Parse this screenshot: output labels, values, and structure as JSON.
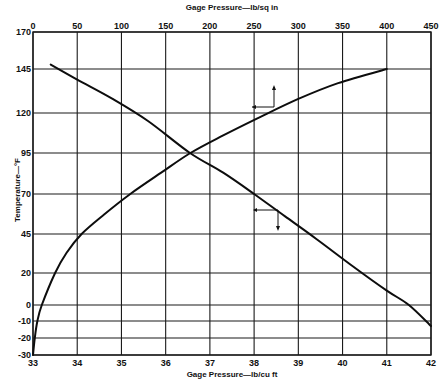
{
  "chart_data": {
    "type": "line",
    "title": "",
    "x_top": {
      "label": "Gage Pressure—lb/sq in",
      "ticks": [
        0,
        50,
        100,
        150,
        200,
        250,
        300,
        350,
        400,
        450
      ],
      "range": [
        0,
        450
      ]
    },
    "x_bottom": {
      "label": "Gage Pressure—lb/cu ft",
      "ticks": [
        33,
        34,
        35,
        36,
        37,
        38,
        39,
        40,
        41,
        42
      ],
      "range": [
        33,
        42
      ]
    },
    "y": {
      "label": "Temperature—°F",
      "ticks": [
        170,
        145,
        120,
        95,
        70,
        45,
        20,
        0,
        -10,
        -20,
        -30
      ],
      "range": [
        -30,
        170
      ]
    },
    "grid": true,
    "series": [
      {
        "name": "Temperature vs gage pressure (lb/sq in)",
        "axis": "top",
        "points": [
          {
            "x": 0,
            "y": -30
          },
          {
            "x": 2,
            "y": -20
          },
          {
            "x": 5,
            "y": -10
          },
          {
            "x": 10,
            "y": 0
          },
          {
            "x": 25,
            "y": 20
          },
          {
            "x": 38,
            "y": 33
          },
          {
            "x": 55,
            "y": 45
          },
          {
            "x": 80,
            "y": 57
          },
          {
            "x": 110,
            "y": 70
          },
          {
            "x": 145,
            "y": 83
          },
          {
            "x": 178,
            "y": 95
          },
          {
            "x": 215,
            "y": 106
          },
          {
            "x": 255,
            "y": 117
          },
          {
            "x": 300,
            "y": 128
          },
          {
            "x": 345,
            "y": 137
          },
          {
            "x": 400,
            "y": 145
          }
        ],
        "annotation": "arrow pointing to top axis (lb/sq in)"
      },
      {
        "name": "Temperature vs gage pressure (lb/cu ft)",
        "axis": "bottom",
        "points": [
          {
            "x": 33.4,
            "y": 148
          },
          {
            "x": 34.0,
            "y": 139
          },
          {
            "x": 34.8,
            "y": 128
          },
          {
            "x": 35.6,
            "y": 115
          },
          {
            "x": 36.55,
            "y": 95
          },
          {
            "x": 37.3,
            "y": 83
          },
          {
            "x": 38.0,
            "y": 70
          },
          {
            "x": 38.7,
            "y": 56
          },
          {
            "x": 39.4,
            "y": 42
          },
          {
            "x": 40.2,
            "y": 25
          },
          {
            "x": 41.0,
            "y": 9
          },
          {
            "x": 41.5,
            "y": 0
          },
          {
            "x": 42.0,
            "y": -13
          }
        ],
        "annotation": "arrow pointing to bottom axis (lb/cu ft)"
      }
    ]
  },
  "labels": {
    "top_axis_title": "Gage Pressure—lb/sq in",
    "bottom_axis_title": "Gage Pressure—lb/cu ft",
    "y_axis_title": "Temperature—°F"
  }
}
